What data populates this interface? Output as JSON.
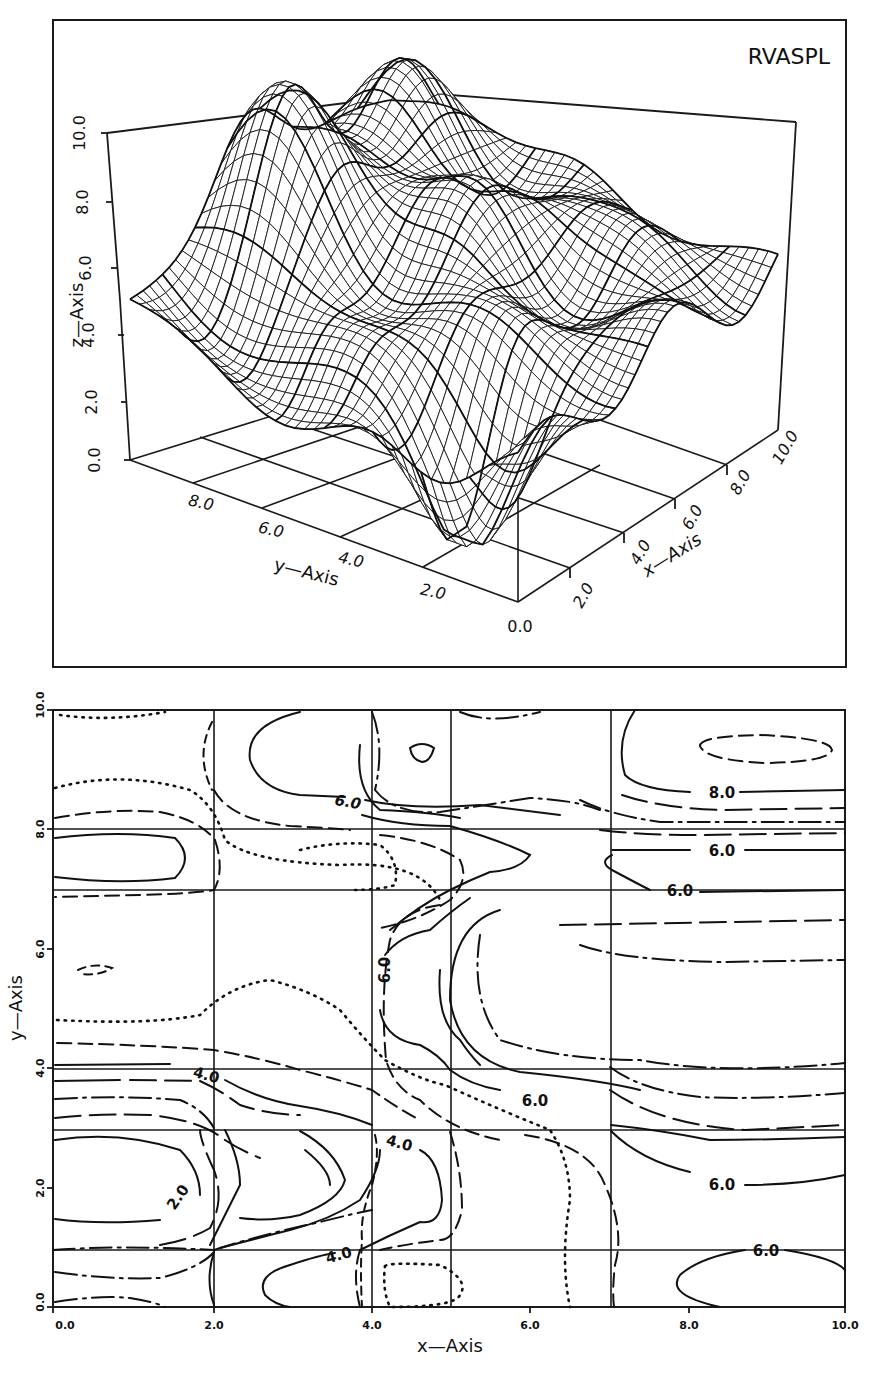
{
  "figure": {
    "surface_title": "RVASPL",
    "contour_xlabel": "x—Axis",
    "contour_ylabel": "y—Axis"
  },
  "surface": {
    "x_axis_label": "x—Axis",
    "y_axis_label": "y—Axis",
    "z_axis_label": "z—Axis",
    "x_ticks": [
      "0.0",
      "2.0",
      "4.0",
      "6.0",
      "8.0",
      "10.0"
    ],
    "y_ticks": [
      "2.0",
      "4.0",
      "6.0",
      "8.0"
    ],
    "z_ticks": [
      "0.0",
      "2.0",
      "4.0",
      "6.0",
      "8.0",
      "10.0"
    ]
  },
  "contour": {
    "x_ticks": [
      "0.0",
      "2.0",
      "4.0",
      "6.0",
      "8.0",
      "10.0"
    ],
    "y_ticks": [
      "0.0",
      "2.0",
      "4.0",
      "6.0",
      "8.0",
      "10.0"
    ],
    "level_labels": [
      "6.0",
      "8.0",
      "6.0",
      "6.0",
      "6.0",
      "6.0",
      "6.0",
      "6.0",
      "4.0",
      "4.0",
      "2.0",
      "4.0",
      "6.0"
    ]
  },
  "chart_data": [
    {
      "type": "surface",
      "title": "RVASPL",
      "xlabel": "x-Axis",
      "ylabel": "y-Axis",
      "zlabel": "z-Axis",
      "xlim": [
        0,
        10
      ],
      "ylim": [
        0,
        10
      ],
      "zlim": [
        0,
        10
      ],
      "x_ticks": [
        0,
        2,
        4,
        6,
        8,
        10
      ],
      "y_ticks": [
        2,
        4,
        6,
        8
      ],
      "z_ticks": [
        0,
        2,
        4,
        6,
        8,
        10
      ],
      "description": "Wireframe mesh of a smooth interpolated surface; low valley (~0-2) near x=1-3,y=1-3 region, ridges up to ~9-10 near x=4-5,y=9, values ~5 at far edges",
      "grid": true
    },
    {
      "type": "contour",
      "xlabel": "x-Axis",
      "ylabel": "y-Axis",
      "xlim": [
        0,
        10
      ],
      "ylim": [
        0,
        10
      ],
      "x_ticks": [
        0.0,
        2.0,
        4.0,
        6.0,
        8.0,
        10.0
      ],
      "y_ticks": [
        0.0,
        2.0,
        4.0,
        6.0,
        8.0,
        10.0
      ],
      "grid_lines_x": [
        2.0,
        4.0,
        5.0,
        7.0
      ],
      "grid_lines_y": [
        1.0,
        3.0,
        4.0,
        7.0,
        8.0
      ],
      "labeled_levels": [
        2.0,
        4.0,
        6.0,
        8.0
      ],
      "label_positions": [
        {
          "level": 6.0,
          "x": 3.6,
          "y": 8.3
        },
        {
          "level": 8.0,
          "x": 8.3,
          "y": 8.3
        },
        {
          "level": 6.0,
          "x": 8.3,
          "y": 7.4
        },
        {
          "level": 6.0,
          "x": 7.8,
          "y": 6.9
        },
        {
          "level": 6.0,
          "x": 4.1,
          "y": 5.8
        },
        {
          "level": 6.0,
          "x": 6.0,
          "y": 3.5
        },
        {
          "level": 6.0,
          "x": 8.4,
          "y": 1.9
        },
        {
          "level": 6.0,
          "x": 9.1,
          "y": 0.9
        },
        {
          "level": 4.0,
          "x": 1.9,
          "y": 3.9
        },
        {
          "level": 4.0,
          "x": 4.3,
          "y": 2.8
        },
        {
          "level": 2.0,
          "x": 1.6,
          "y": 1.8
        },
        {
          "level": 4.0,
          "x": 3.8,
          "y": 0.8
        }
      ],
      "line_styles": [
        "solid",
        "dashed",
        "long-dashed",
        "dotted",
        "dash-dot"
      ],
      "legend": "none"
    }
  ]
}
